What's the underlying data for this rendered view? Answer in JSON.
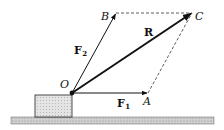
{
  "diagram": {
    "points": {
      "O": {
        "label": "O",
        "x": 72,
        "y": 93
      },
      "A": {
        "label": "A",
        "x": 148,
        "y": 93
      },
      "B": {
        "label": "B",
        "x": 116,
        "y": 13
      },
      "C": {
        "label": "C",
        "x": 192,
        "y": 13
      }
    },
    "vectors": [
      {
        "id": "F1",
        "label": "F",
        "subscript": "1",
        "from": "O",
        "to": "A"
      },
      {
        "id": "F2",
        "label": "F",
        "subscript": "2",
        "from": "O",
        "to": "B"
      },
      {
        "id": "R",
        "label": "R",
        "from": "O",
        "to": "C"
      }
    ],
    "dashed_edges": [
      {
        "from": "B",
        "to": "C"
      },
      {
        "from": "A",
        "to": "C"
      }
    ],
    "colors": {
      "line": "#111111",
      "block_fill": "#d9d9d9",
      "ground_fill": "#bdbdbd"
    }
  }
}
